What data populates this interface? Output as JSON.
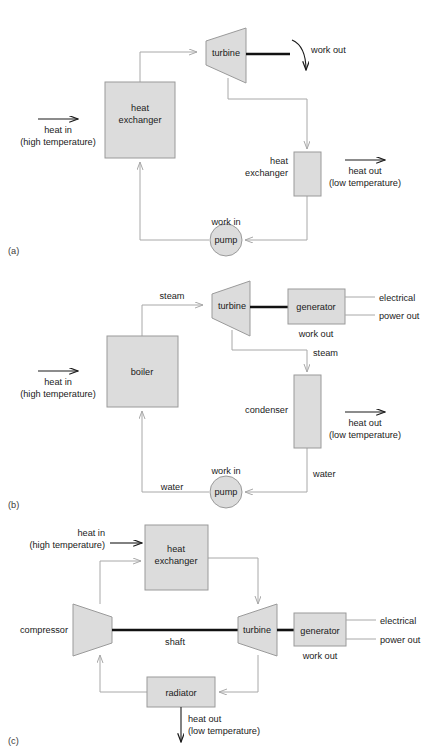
{
  "figure": {
    "kind": "thermodynamic-cycle-diagrams",
    "panels": [
      {
        "tag": "(a)",
        "name": "generic-heat-engine-cycle",
        "nodes": {
          "heat_exchanger_hot": "heat\nexchanger",
          "heat_exchanger_hot_line1": "heat",
          "heat_exchanger_hot_line2": "exchanger",
          "turbine": "turbine",
          "heat_exchanger_cold_line1": "heat",
          "heat_exchanger_cold_line2": "exchanger",
          "pump": "pump"
        },
        "labels": {
          "heat_in_line1": "heat in",
          "heat_in_line2": "(high temperature)",
          "heat_out_line1": "heat out",
          "heat_out_line2": "(low temperature)",
          "work_out": "work out",
          "work_in": "work in"
        }
      },
      {
        "tag": "(b)",
        "name": "steam-power-plant-cycle",
        "nodes": {
          "boiler": "boiler",
          "turbine": "turbine",
          "generator": "generator",
          "condenser": "condenser",
          "pump": "pump"
        },
        "labels": {
          "heat_in_line1": "heat in",
          "heat_in_line2": "(high temperature)",
          "heat_out_line1": "heat out",
          "heat_out_line2": "(low temperature)",
          "steam_top": "steam",
          "steam_right": "steam",
          "water_right": "water",
          "water_bottom": "water",
          "work_in": "work in",
          "work_out": "work out",
          "electrical_line1": "electrical",
          "electrical_line2": "power out"
        }
      },
      {
        "tag": "(c)",
        "name": "closed-brayton-gas-turbine-cycle",
        "nodes": {
          "heat_exchanger_line1": "heat",
          "heat_exchanger_line2": "exchanger",
          "compressor": "compressor",
          "turbine": "turbine",
          "generator": "generator",
          "radiator": "radiator"
        },
        "labels": {
          "heat_in_line1": "heat in",
          "heat_in_line2": "(high temperature)",
          "heat_out_line1": "heat out",
          "heat_out_line2": "(low temperature)",
          "shaft": "shaft",
          "work_out": "work out",
          "electrical_line1": "electrical",
          "electrical_line2": "power out"
        }
      }
    ]
  },
  "style": {
    "shape_fill": "#dcdcdc",
    "shape_stroke": "#9a9a9a",
    "flow_stroke": "#a8a8a8",
    "shaft_stroke": "#111111",
    "text_color": "#1a1a1a",
    "background": "#ffffff"
  }
}
